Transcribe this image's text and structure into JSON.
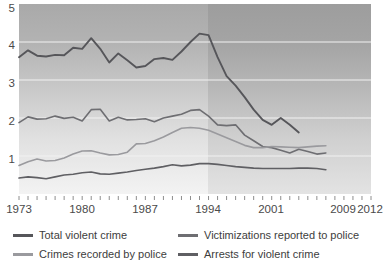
{
  "chart_data": {
    "type": "line",
    "title": "",
    "subtitle": "",
    "xlabel": "",
    "ylabel": "",
    "xlim": [
      1973,
      2012
    ],
    "ylim": [
      0,
      5
    ],
    "grid": true,
    "legend_position": "bottom",
    "xticks": [
      1973,
      1980,
      1987,
      1994,
      2001,
      2009,
      2012
    ],
    "xtick_labels": [
      "1973",
      "1980",
      "1987",
      "1994",
      "2001",
      "2009",
      "2012"
    ],
    "minor_xticks_every": 1,
    "yticks": [
      1,
      2,
      3,
      4,
      5
    ],
    "ytick_labels": [
      "1",
      "2",
      "3",
      "4",
      "5"
    ],
    "series": [
      {
        "name": "Total violent crime",
        "color": "#56565a",
        "x": [
          1973,
          1974,
          1975,
          1976,
          1977,
          1978,
          1979,
          1980,
          1981,
          1982,
          1983,
          1984,
          1985,
          1986,
          1987,
          1988,
          1989,
          1990,
          1991,
          1992,
          1993,
          1994,
          1995,
          1996,
          1997,
          1998,
          1999,
          2000,
          2001,
          2002,
          2003,
          2004,
          2005,
          2006,
          2007
        ],
        "values": [
          3.6,
          3.78,
          3.64,
          3.62,
          3.66,
          3.65,
          3.85,
          3.82,
          4.1,
          3.82,
          3.46,
          3.7,
          3.52,
          3.33,
          3.37,
          3.55,
          3.58,
          3.53,
          3.75,
          4.0,
          4.22,
          4.18,
          3.6,
          3.1,
          2.85,
          2.55,
          2.22,
          1.95,
          1.82,
          2.0,
          1.82,
          1.62,
          null,
          null,
          null
        ]
      },
      {
        "name": "Victimizations reported to police",
        "color": "#6e6e72",
        "x": [
          1973,
          1974,
          1975,
          1976,
          1977,
          1978,
          1979,
          1980,
          1981,
          1982,
          1983,
          1984,
          1985,
          1986,
          1987,
          1988,
          1989,
          1990,
          1991,
          1992,
          1993,
          1994,
          1995,
          1996,
          1997,
          1998,
          1999,
          2000,
          2001,
          2002,
          2003,
          2004,
          2005,
          2006,
          2007
        ],
        "values": [
          1.88,
          2.03,
          1.97,
          1.98,
          2.05,
          1.99,
          2.02,
          1.92,
          2.22,
          2.23,
          1.92,
          2.02,
          1.95,
          1.96,
          1.98,
          1.9,
          2.0,
          2.05,
          2.1,
          2.2,
          2.22,
          2.05,
          1.82,
          1.8,
          1.82,
          1.55,
          1.4,
          1.25,
          1.22,
          1.15,
          1.08,
          1.18,
          1.12,
          1.05,
          1.08
        ]
      },
      {
        "name": "Crimes recorded by police",
        "color": "#9a9a9e",
        "x": [
          1973,
          1974,
          1975,
          1976,
          1977,
          1978,
          1979,
          1980,
          1981,
          1982,
          1983,
          1984,
          1985,
          1986,
          1987,
          1988,
          1989,
          1990,
          1991,
          1992,
          1993,
          1994,
          1995,
          1996,
          1997,
          1998,
          1999,
          2000,
          2001,
          2002,
          2003,
          2004,
          2005,
          2006,
          2007
        ],
        "values": [
          0.75,
          0.85,
          0.92,
          0.87,
          0.88,
          0.95,
          1.05,
          1.13,
          1.14,
          1.08,
          1.03,
          1.04,
          1.1,
          1.32,
          1.33,
          1.4,
          1.5,
          1.62,
          1.73,
          1.75,
          1.73,
          1.68,
          1.58,
          1.48,
          1.38,
          1.28,
          1.22,
          1.22,
          1.25,
          1.24,
          1.23,
          1.22,
          1.24,
          1.26,
          1.27
        ]
      },
      {
        "name": "Arrests for violent crime",
        "color": "#5f5f63",
        "x": [
          1973,
          1974,
          1975,
          1976,
          1977,
          1978,
          1979,
          1980,
          1981,
          1982,
          1983,
          1984,
          1985,
          1986,
          1987,
          1988,
          1989,
          1990,
          1991,
          1992,
          1993,
          1994,
          1995,
          1996,
          1997,
          1998,
          1999,
          2000,
          2001,
          2002,
          2003,
          2004,
          2005,
          2006,
          2007
        ],
        "values": [
          0.42,
          0.45,
          0.43,
          0.4,
          0.45,
          0.5,
          0.52,
          0.56,
          0.58,
          0.53,
          0.52,
          0.55,
          0.58,
          0.62,
          0.65,
          0.68,
          0.72,
          0.77,
          0.74,
          0.76,
          0.8,
          0.8,
          0.78,
          0.75,
          0.72,
          0.7,
          0.68,
          0.67,
          0.67,
          0.67,
          0.67,
          0.68,
          0.68,
          0.67,
          0.64
        ]
      }
    ],
    "annotations": {
      "shading_note": "Plot background is a vertical gradient from dark gray at top to light gray at bottom; a lighter vertical band spans 1973–1994.",
      "light_band_range": [
        1973,
        1994
      ]
    }
  },
  "legend": {
    "items": [
      {
        "label": "Total violent crime",
        "color": "#56565a"
      },
      {
        "label": "Victimizations reported to police",
        "color": "#6e6e72"
      },
      {
        "label": "Crimes recorded by police",
        "color": "#9a9a9e"
      },
      {
        "label": "Arrests for violent crime",
        "color": "#5f5f63"
      }
    ]
  },
  "axis": {
    "y_labels": [
      "5",
      "4",
      "3",
      "2",
      "1"
    ],
    "x_labels": [
      "1973",
      "1980",
      "1987",
      "1994",
      "2001",
      "2009",
      "2012"
    ]
  }
}
